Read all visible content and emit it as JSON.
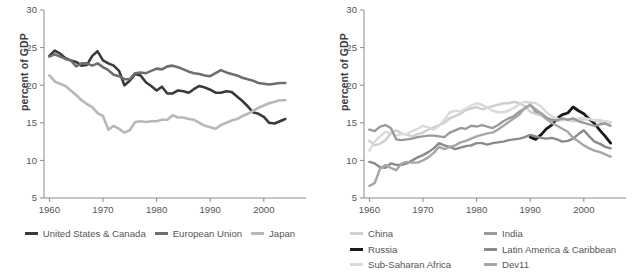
{
  "figure": {
    "background": "#ffffff",
    "panels": 2
  },
  "chart_data": [
    {
      "type": "line",
      "title": "",
      "xlabel": "",
      "ylabel": "percent of GDP",
      "xlim": [
        1959,
        2006
      ],
      "ylim": [
        5,
        30
      ],
      "xticks": [
        1960,
        1970,
        1980,
        1990,
        2000
      ],
      "yticks": [
        5,
        10,
        15,
        20,
        25,
        30
      ],
      "grid": false,
      "legend_position": "below",
      "x": [
        1960,
        1961,
        1962,
        1963,
        1964,
        1965,
        1966,
        1967,
        1968,
        1969,
        1970,
        1971,
        1972,
        1973,
        1974,
        1975,
        1976,
        1977,
        1978,
        1979,
        1980,
        1981,
        1982,
        1983,
        1984,
        1985,
        1986,
        1987,
        1988,
        1989,
        1990,
        1991,
        1992,
        1993,
        1994,
        1995,
        1996,
        1997,
        1998,
        1999,
        2000,
        2001,
        2002,
        2003,
        2004
      ],
      "series": [
        {
          "name": "United States & Canada",
          "color": "#3a3a3a",
          "width": 2.6,
          "values": [
            23.9,
            24.6,
            24.2,
            23.6,
            23.3,
            23.1,
            22.6,
            22.7,
            23.9,
            24.5,
            23.3,
            22.9,
            22.6,
            21.9,
            20.0,
            20.6,
            21.5,
            21.3,
            20.4,
            19.9,
            19.3,
            19.8,
            18.9,
            18.9,
            19.3,
            19.2,
            19.0,
            19.5,
            19.9,
            19.7,
            19.4,
            19.0,
            19.0,
            19.2,
            19.1,
            18.5,
            17.9,
            17.2,
            16.4,
            16.2,
            15.8,
            15.0,
            14.9,
            15.2,
            15.5
          ]
        },
        {
          "name": "European Union",
          "color": "#6e6e6e",
          "width": 2.6,
          "values": [
            23.8,
            24.1,
            23.8,
            23.5,
            23.3,
            22.5,
            22.9,
            22.9,
            22.6,
            22.9,
            22.4,
            22.0,
            21.4,
            21.2,
            20.8,
            20.8,
            21.6,
            21.7,
            21.6,
            21.9,
            22.2,
            22.1,
            22.5,
            22.6,
            22.4,
            22.1,
            21.8,
            21.6,
            21.5,
            21.3,
            21.2,
            21.6,
            22.0,
            21.7,
            21.5,
            21.3,
            21.0,
            20.8,
            20.6,
            20.3,
            20.2,
            20.1,
            20.2,
            20.3,
            20.3
          ]
        },
        {
          "name": "Japan",
          "color": "#b8b8b8",
          "width": 2.6,
          "values": [
            21.3,
            20.5,
            20.2,
            19.9,
            19.3,
            18.7,
            18.0,
            17.5,
            17.1,
            16.3,
            15.9,
            14.1,
            14.6,
            14.2,
            13.7,
            14.0,
            15.1,
            15.2,
            15.1,
            15.2,
            15.2,
            15.4,
            15.4,
            16.0,
            15.7,
            15.7,
            15.5,
            15.4,
            15.0,
            14.6,
            14.4,
            14.2,
            14.7,
            15.0,
            15.3,
            15.5,
            15.9,
            16.2,
            16.6,
            17.0,
            17.3,
            17.6,
            17.8,
            18.0,
            18.0
          ]
        }
      ]
    },
    {
      "type": "line",
      "title": "",
      "xlabel": "",
      "ylabel": "percent of GDP",
      "xlim": [
        1959,
        2006
      ],
      "ylim": [
        5,
        30
      ],
      "xticks": [
        1960,
        1970,
        1980,
        1990,
        2000
      ],
      "yticks": [
        5,
        10,
        15,
        20,
        25,
        30
      ],
      "grid": false,
      "legend_position": "below",
      "x": [
        1960,
        1961,
        1962,
        1963,
        1964,
        1965,
        1966,
        1967,
        1968,
        1969,
        1970,
        1971,
        1972,
        1973,
        1974,
        1975,
        1976,
        1977,
        1978,
        1979,
        1980,
        1981,
        1982,
        1983,
        1984,
        1985,
        1986,
        1987,
        1988,
        1989,
        1990,
        1991,
        1992,
        1993,
        1994,
        1995,
        1996,
        1997,
        1998,
        1999,
        2000,
        2001,
        2002,
        2003,
        2004,
        2005
      ],
      "series": [
        {
          "name": "China",
          "color": "#cfcfcf",
          "width": 2.4,
          "values": [
            12.6,
            12.0,
            12.2,
            12.7,
            13.6,
            14.0,
            13.6,
            13.4,
            13.2,
            13.5,
            13.7,
            14.1,
            14.4,
            14.7,
            15.0,
            15.6,
            15.9,
            16.2,
            16.7,
            16.9,
            17.1,
            16.8,
            17.0,
            17.2,
            17.4,
            17.6,
            17.6,
            17.8,
            17.6,
            17.2,
            16.5,
            16.2,
            16.0,
            15.6,
            15.4,
            15.3,
            15.5,
            15.4,
            15.2,
            15.3,
            15.5,
            15.4,
            15.3,
            15.2,
            15.1,
            15.0
          ]
        },
        {
          "name": "Russia",
          "color": "#1a1a1a",
          "width": 2.8,
          "values": [
            null,
            null,
            null,
            null,
            null,
            null,
            null,
            null,
            null,
            null,
            null,
            null,
            null,
            null,
            null,
            null,
            null,
            null,
            null,
            null,
            null,
            null,
            null,
            null,
            null,
            null,
            null,
            null,
            null,
            null,
            13.1,
            12.8,
            13.4,
            14.2,
            14.7,
            15.6,
            16.1,
            16.3,
            17.1,
            16.6,
            16.2,
            15.5,
            14.9,
            14.0,
            13.2,
            12.3
          ]
        },
        {
          "name": "Sub-Saharan Africa",
          "color": "#dadada",
          "width": 2.4,
          "values": [
            11.3,
            12.5,
            13.2,
            13.8,
            13.6,
            13.3,
            13.5,
            13.5,
            13.9,
            14.2,
            14.6,
            14.4,
            14.1,
            14.6,
            15.4,
            16.4,
            16.6,
            16.5,
            16.9,
            17.3,
            17.6,
            17.4,
            17.0,
            16.6,
            16.4,
            16.4,
            16.6,
            17.0,
            17.5,
            17.8,
            17.7,
            17.6,
            17.2,
            16.4,
            15.9,
            15.6,
            15.3,
            15.5,
            15.4,
            15.6,
            15.6,
            15.5,
            15.3,
            15.4,
            15.2,
            15.1
          ]
        },
        {
          "name": "India",
          "color": "#9a9a9a",
          "width": 2.4,
          "values": [
            14.1,
            13.9,
            14.5,
            14.7,
            14.3,
            12.8,
            12.7,
            12.8,
            12.9,
            13.1,
            13.2,
            13.3,
            13.3,
            13.2,
            13.1,
            13.7,
            14.0,
            14.3,
            14.2,
            14.6,
            14.5,
            14.7,
            14.5,
            14.3,
            14.7,
            15.2,
            15.6,
            15.9,
            16.5,
            16.9,
            17.4,
            16.5,
            16.3,
            15.7,
            15.4,
            15.3,
            15.6,
            15.4,
            15.6,
            15.2,
            15.0,
            14.8,
            14.6,
            14.8,
            14.9,
            14.6
          ]
        },
        {
          "name": "Latin America & Caribbean",
          "color": "#8a8a8a",
          "width": 2.4,
          "values": [
            9.8,
            9.6,
            9.1,
            9.0,
            9.6,
            9.4,
            9.4,
            9.6,
            10.0,
            10.4,
            10.7,
            11.1,
            11.6,
            12.3,
            12.0,
            11.8,
            11.5,
            11.7,
            11.9,
            12.0,
            12.3,
            12.3,
            12.1,
            12.3,
            12.4,
            12.5,
            12.7,
            12.8,
            12.9,
            13.1,
            13.4,
            13.2,
            13.0,
            12.9,
            13.0,
            12.8,
            12.5,
            12.6,
            12.9,
            13.5,
            14.0,
            13.2,
            12.5,
            12.2,
            11.8,
            11.6
          ]
        },
        {
          "name": "Dev11",
          "color": "#a6a6a6",
          "width": 2.4,
          "values": [
            6.6,
            7.0,
            8.9,
            9.4,
            9.0,
            8.7,
            9.6,
            9.8,
            9.7,
            9.7,
            10.0,
            10.4,
            11.0,
            11.8,
            11.5,
            11.8,
            12.0,
            12.4,
            12.6,
            12.9,
            13.2,
            13.4,
            13.6,
            13.7,
            14.1,
            14.6,
            15.1,
            15.6,
            16.1,
            17.0,
            17.4,
            16.8,
            16.2,
            15.5,
            15.0,
            14.6,
            14.2,
            13.8,
            13.0,
            12.5,
            12.0,
            11.6,
            11.3,
            11.1,
            10.8,
            10.5
          ]
        }
      ]
    }
  ],
  "left_panel": {
    "ylabel": "percent of GDP",
    "legend": [
      {
        "label": "United States & Canada",
        "color": "#3a3a3a"
      },
      {
        "label": "European Union",
        "color": "#6e6e6e"
      },
      {
        "label": "Japan",
        "color": "#b8b8b8"
      }
    ],
    "yticks": [
      "30",
      "25",
      "20",
      "15",
      "10",
      "5"
    ],
    "xticks": [
      "1960",
      "1970",
      "1980",
      "1990",
      "2000"
    ]
  },
  "right_panel": {
    "ylabel": "percent of GDP",
    "legend": [
      {
        "label": "China",
        "color": "#cfcfcf"
      },
      {
        "label": "India",
        "color": "#9a9a9a"
      },
      {
        "label": "Russia",
        "color": "#1a1a1a"
      },
      {
        "label": "Latin America & Caribbean",
        "color": "#8a8a8a"
      },
      {
        "label": "Sub-Saharan Africa",
        "color": "#dadada"
      },
      {
        "label": "Dev11",
        "color": "#a6a6a6"
      }
    ],
    "yticks": [
      "30",
      "25",
      "20",
      "15",
      "10",
      "5"
    ],
    "xticks": [
      "1960",
      "1970",
      "1980",
      "1990",
      "2000"
    ]
  }
}
